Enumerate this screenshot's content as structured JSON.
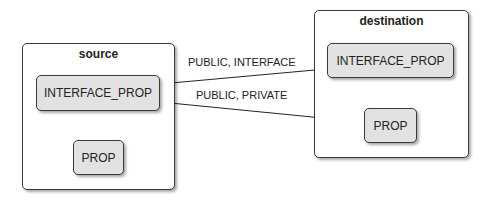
{
  "diagram": {
    "containers": [
      {
        "id": "source",
        "title": "source",
        "nodes": [
          {
            "id": "src_interface_prop",
            "label": "INTERFACE_PROP"
          },
          {
            "id": "src_prop",
            "label": "PROP"
          }
        ]
      },
      {
        "id": "destination",
        "title": "destination",
        "nodes": [
          {
            "id": "dst_interface_prop",
            "label": "INTERFACE_PROP"
          },
          {
            "id": "dst_prop",
            "label": "PROP"
          }
        ]
      }
    ],
    "edges": [
      {
        "from": "src_interface_prop",
        "to": "dst_interface_prop",
        "label": "PUBLIC, INTERFACE"
      },
      {
        "from": "src_interface_prop",
        "to": "dst_prop",
        "label": "PUBLIC, PRIVATE"
      }
    ],
    "colors": {
      "node_fill": "#e2e2e2",
      "border": "#3a3a3a",
      "container_fill": "#ffffff"
    }
  }
}
